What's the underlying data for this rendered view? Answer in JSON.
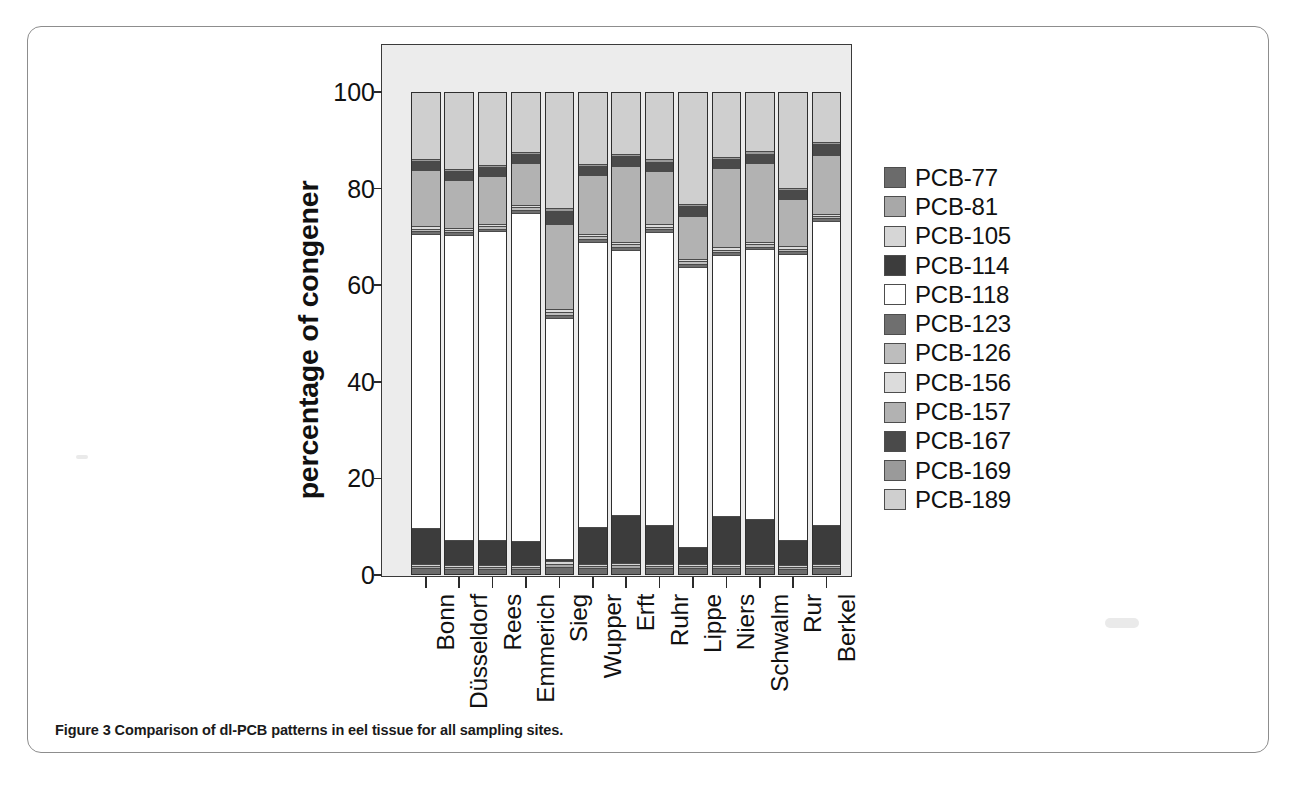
{
  "figure": {
    "caption_label": "Figure 3",
    "caption_text": "Comparison of dl-PCB patterns in eel tissue for all sampling sites."
  },
  "chart_data": {
    "type": "bar",
    "stacked": true,
    "title": "",
    "xlabel": "",
    "ylabel": "percentage of congener",
    "ylim": [
      0,
      100
    ],
    "yticks": [
      0,
      20,
      40,
      60,
      80,
      100
    ],
    "grid": false,
    "legend_position": "right",
    "categories": [
      "Bonn",
      "Düsseldorf",
      "Rees",
      "Emmerich",
      "Sieg",
      "Wupper",
      "Erft",
      "Ruhr",
      "Lippe",
      "Niers",
      "Schwalm",
      "Rur",
      "Berkel"
    ],
    "series": [
      {
        "name": "PCB-77",
        "color": "#6b6b6b",
        "values": [
          1.2,
          1.0,
          1.0,
          1.0,
          1.5,
          1.2,
          1.3,
          1.2,
          1.2,
          1.2,
          1.2,
          1.0,
          1.2
        ]
      },
      {
        "name": "PCB-81",
        "color": "#a8a8a8",
        "values": [
          0.5,
          0.4,
          0.4,
          0.4,
          0.6,
          0.5,
          0.5,
          0.5,
          0.5,
          0.5,
          0.5,
          0.4,
          0.5
        ]
      },
      {
        "name": "PCB-105",
        "color": "#d6d6d6",
        "values": [
          0.4,
          0.4,
          0.4,
          0.4,
          0.6,
          0.4,
          0.4,
          0.4,
          0.4,
          0.4,
          0.4,
          0.4,
          0.4
        ]
      },
      {
        "name": "PCB-114",
        "color": "#3c3c3c",
        "values": [
          7.4,
          5.2,
          5.2,
          5.0,
          0.5,
          7.6,
          10.0,
          8.0,
          3.5,
          10.0,
          9.4,
          5.3,
          8.0
        ]
      },
      {
        "name": "PCB-118",
        "color": "#ffffff",
        "values": [
          61.2,
          63.4,
          64.2,
          68.3,
          50.0,
          59.4,
          55.2,
          61.0,
          58.3,
          54.2,
          56.3,
          59.4,
          63.2
        ]
      },
      {
        "name": "PCB-123",
        "color": "#6f6f6f",
        "values": [
          0.6,
          0.6,
          0.6,
          0.6,
          0.7,
          0.6,
          0.6,
          0.6,
          0.6,
          0.6,
          0.6,
          0.6,
          0.6
        ]
      },
      {
        "name": "PCB-126",
        "color": "#bdbdbd",
        "values": [
          0.5,
          0.5,
          0.5,
          0.5,
          0.6,
          0.5,
          0.5,
          0.5,
          0.5,
          0.5,
          0.5,
          0.5,
          0.5
        ]
      },
      {
        "name": "PCB-156",
        "color": "#dcdcdc",
        "values": [
          0.5,
          0.5,
          0.5,
          0.5,
          0.6,
          0.5,
          0.5,
          0.5,
          0.5,
          0.5,
          0.5,
          0.5,
          0.5
        ]
      },
      {
        "name": "PCB-157",
        "color": "#b2b2b2",
        "values": [
          11.6,
          9.9,
          9.9,
          8.7,
          17.6,
          12.2,
          15.9,
          11.1,
          8.9,
          16.4,
          16.5,
          9.8,
          12.3
        ]
      },
      {
        "name": "PCB-167",
        "color": "#4a4a4a",
        "values": [
          1.9,
          1.8,
          1.9,
          1.9,
          2.7,
          1.9,
          1.9,
          1.9,
          2.1,
          1.9,
          1.9,
          1.9,
          2.1
        ]
      },
      {
        "name": "PCB-169",
        "color": "#9a9a9a",
        "values": [
          0.5,
          0.5,
          0.5,
          0.5,
          0.6,
          0.5,
          0.5,
          0.5,
          0.5,
          0.5,
          0.5,
          0.5,
          0.5
        ]
      },
      {
        "name": "PCB-189",
        "color": "#cfcfcf",
        "values": [
          13.7,
          15.8,
          14.9,
          12.2,
          24.0,
          14.7,
          12.7,
          13.8,
          23.0,
          13.3,
          12.2,
          19.7,
          10.2
        ]
      }
    ],
    "segment_tops_percent": {
      "note": "cumulative top of each stacked segment, bottom-to-top, per category"
    }
  },
  "legend": {
    "items": [
      {
        "label": "PCB-77",
        "color": "#6b6b6b"
      },
      {
        "label": "PCB-81",
        "color": "#a8a8a8"
      },
      {
        "label": "PCB-105",
        "color": "#d6d6d6"
      },
      {
        "label": "PCB-114",
        "color": "#3c3c3c"
      },
      {
        "label": "PCB-118",
        "color": "#ffffff"
      },
      {
        "label": "PCB-123",
        "color": "#6f6f6f"
      },
      {
        "label": "PCB-126",
        "color": "#bdbdbd"
      },
      {
        "label": "PCB-156",
        "color": "#dcdcdc"
      },
      {
        "label": "PCB-157",
        "color": "#b2b2b2"
      },
      {
        "label": "PCB-167",
        "color": "#4a4a4a"
      },
      {
        "label": "PCB-169",
        "color": "#9a9a9a"
      },
      {
        "label": "PCB-189",
        "color": "#cfcfcf"
      }
    ]
  },
  "colors": {
    "panel_background": "#ececec",
    "axis": "#2b2b2b",
    "frame": "#8d8d8d",
    "text": "#111111"
  }
}
